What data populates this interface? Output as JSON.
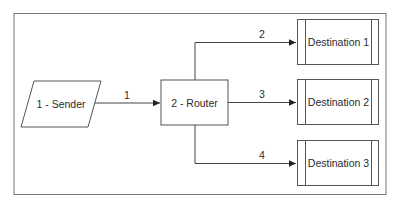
{
  "diagram": {
    "type": "flowchart",
    "colors": {
      "stroke": "#555555",
      "text": "#2b2b2b",
      "background": "#ffffff"
    },
    "nodes": [
      {
        "id": "sender",
        "shape": "parallelogram",
        "label": "1 - Sender"
      },
      {
        "id": "router",
        "shape": "rectangle",
        "label": "2 - Router"
      },
      {
        "id": "dest1",
        "shape": "predefined-process",
        "label": "Destination 1"
      },
      {
        "id": "dest2",
        "shape": "predefined-process",
        "label": "Destination 2"
      },
      {
        "id": "dest3",
        "shape": "predefined-process",
        "label": "Destination 3"
      }
    ],
    "edges": [
      {
        "from": "sender",
        "to": "router",
        "label": "1"
      },
      {
        "from": "router",
        "to": "dest1",
        "label": "2"
      },
      {
        "from": "router",
        "to": "dest2",
        "label": "3"
      },
      {
        "from": "router",
        "to": "dest3",
        "label": "4"
      }
    ]
  }
}
